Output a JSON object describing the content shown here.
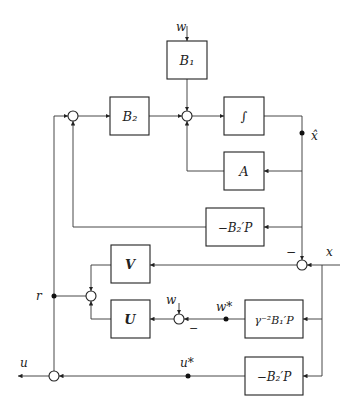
{
  "diagram": {
    "type": "block-diagram",
    "blocks": {
      "b1": "B₁",
      "b2": "B₂",
      "integrator": "∫",
      "a": "A",
      "neg_b2p_top": "−B₂′P",
      "v": "V",
      "u": "U",
      "gamma": "γ⁻²B₁′P",
      "neg_b2p_bottom": "−B₂′P"
    },
    "signals": {
      "w_top": "w",
      "xhat": "x̂",
      "x": "x",
      "minus_x": "−",
      "r": "r",
      "w_mid": "w",
      "minus_w": "−",
      "wstar": "w*",
      "u_out": "u",
      "ustar": "u*"
    },
    "caption": "Figure … H∞ full information controller"
  }
}
